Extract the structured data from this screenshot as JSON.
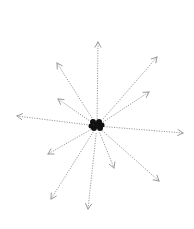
{
  "diagram": {
    "type": "radial-burst",
    "center": {
      "x": 97,
      "y": 126
    },
    "cluster_color": "#111111",
    "arrow_color": "#9a9a9a",
    "cluster_dots": [
      {
        "x": 93,
        "y": 122,
        "r": 3
      },
      {
        "x": 99,
        "y": 122,
        "r": 3
      },
      {
        "x": 94,
        "y": 128,
        "r": 3
      },
      {
        "x": 100,
        "y": 128,
        "r": 3
      },
      {
        "x": 97,
        "y": 125,
        "r": 3
      },
      {
        "x": 102,
        "y": 125,
        "r": 2.5
      },
      {
        "x": 91,
        "y": 126,
        "r": 2.5
      }
    ],
    "arrows": [
      {
        "name": "up",
        "x2": 98,
        "y2": 42
      },
      {
        "name": "upper-right-long",
        "x2": 157,
        "y2": 57
      },
      {
        "name": "upper-right-short",
        "x2": 149,
        "y2": 92
      },
      {
        "name": "upper-left-long",
        "x2": 57,
        "y2": 63
      },
      {
        "name": "upper-left-short",
        "x2": 58,
        "y2": 99
      },
      {
        "name": "left",
        "x2": 17,
        "y2": 116
      },
      {
        "name": "right",
        "x2": 183,
        "y2": 133
      },
      {
        "name": "lower-left-short",
        "x2": 48,
        "y2": 154
      },
      {
        "name": "lower-left-long",
        "x2": 51,
        "y2": 199
      },
      {
        "name": "down",
        "x2": 88,
        "y2": 209
      },
      {
        "name": "lower-right-short",
        "x2": 114,
        "y2": 168
      },
      {
        "name": "lower-right-long",
        "x2": 159,
        "y2": 181
      }
    ]
  }
}
